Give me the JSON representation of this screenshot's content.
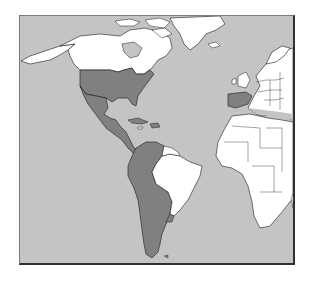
{
  "map": {
    "title": "",
    "region": "Atlantic — Americas, Europe, Africa",
    "legend": [],
    "colors": {
      "ocean": "#c4c4c4",
      "highlighted_land": "#808080",
      "other_land": "#ffffff",
      "border": "#1a1a1a",
      "frame": "#303030"
    },
    "highlighted_countries": [
      "United States",
      "Mexico",
      "Guatemala",
      "Honduras",
      "El Salvador",
      "Nicaragua",
      "Costa Rica",
      "Panama",
      "Cuba",
      "Dominican Republic",
      "Puerto Rico",
      "Colombia",
      "Venezuela",
      "Ecuador",
      "Peru",
      "Bolivia",
      "Chile",
      "Argentina",
      "Paraguay",
      "Uruguay",
      "Spain"
    ],
    "unhighlighted_visible": [
      "Canada",
      "Greenland",
      "Alaska",
      "Brazil",
      "Guyana",
      "Suriname",
      "French Guiana",
      "Haiti",
      "Jamaica",
      "Belize",
      "Europe (other)",
      "Africa"
    ]
  }
}
